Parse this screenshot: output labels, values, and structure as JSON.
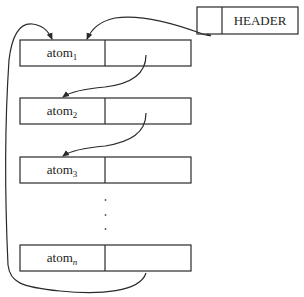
{
  "header": {
    "label": "HEADER"
  },
  "atoms": [
    {
      "base": "atom",
      "sub": "1"
    },
    {
      "base": "atom",
      "sub": "2"
    },
    {
      "base": "atom",
      "sub": "3"
    },
    {
      "base": "atom",
      "sub": "n"
    }
  ],
  "ellipsis": "⋮",
  "colors": {
    "stroke": "#2a2a2a",
    "background": "#ffffff"
  }
}
